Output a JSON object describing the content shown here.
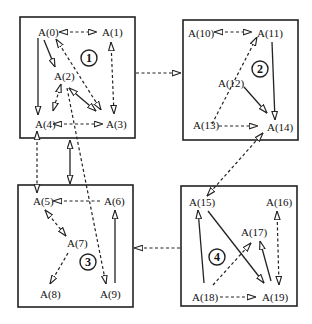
{
  "diagram": {
    "type": "agent-cluster-graph",
    "clusters": [
      {
        "id": "1",
        "label": "1",
        "nodes": [
          "A(0)",
          "A(1)",
          "A(2)",
          "A(3)",
          "A(4)"
        ]
      },
      {
        "id": "2",
        "label": "2",
        "nodes": [
          "A(10)",
          "A(11)",
          "A(12)",
          "A(13)",
          "A(14)"
        ]
      },
      {
        "id": "3",
        "label": "3",
        "nodes": [
          "A(5)",
          "A(6)",
          "A(7)",
          "A(8)",
          "A(9)"
        ]
      },
      {
        "id": "4",
        "label": "4",
        "nodes": [
          "A(15)",
          "A(16)",
          "A(17)",
          "A(18)",
          "A(19)"
        ]
      }
    ],
    "nodes": {
      "n0": "A(0)",
      "n1": "A(1)",
      "n2": "A(2)",
      "n3": "A(3)",
      "n4": "A(4)",
      "n5": "A(5)",
      "n6": "A(6)",
      "n7": "A(7)",
      "n8": "A(8)",
      "n9": "A(9)",
      "n10": "A(10)",
      "n11": "A(11)",
      "n12": "A(12)",
      "n13": "A(13)",
      "n14": "A(14)",
      "n15": "A(15)",
      "n16": "A(16)",
      "n17": "A(17)",
      "n18": "A(18)",
      "n19": "A(19)"
    },
    "cluster_labels": {
      "c1": "1",
      "c2": "2",
      "c3": "3",
      "c4": "4"
    },
    "edges": [
      {
        "from": "A(0)",
        "to": "A(1)",
        "style": "dashed",
        "bidirectional": true
      },
      {
        "from": "A(0)",
        "to": "A(4)",
        "style": "solid"
      },
      {
        "from": "A(0)",
        "to": "A(2)",
        "style": "solid"
      },
      {
        "from": "A(3)",
        "to": "A(0)",
        "style": "dashed",
        "bidirectional": true
      },
      {
        "from": "A(1)",
        "to": "A(3)",
        "style": "dashed",
        "bidirectional": true
      },
      {
        "from": "A(2)",
        "to": "A(3)",
        "style": "solid",
        "bidirectional": true
      },
      {
        "from": "A(2)",
        "to": "A(4)",
        "style": "dashed",
        "bidirectional": true
      },
      {
        "from": "A(4)",
        "to": "A(3)",
        "style": "dashed",
        "bidirectional": true
      },
      {
        "from": "A(2)",
        "to": "A(9)",
        "style": "dashed"
      },
      {
        "from": "A(4)",
        "to": "A(5)",
        "style": "dashed",
        "bidirectional": true
      },
      {
        "from": "cluster 1",
        "to": "cluster 3",
        "style": "solid",
        "bidirectional": true
      },
      {
        "from": "cluster 1",
        "to": "cluster 2",
        "style": "dashed"
      },
      {
        "from": "A(10)",
        "to": "A(11)",
        "style": "dashed",
        "bidirectional": true
      },
      {
        "from": "A(13)",
        "to": "A(11)",
        "style": "dashed"
      },
      {
        "from": "A(11)",
        "to": "A(14)",
        "style": "solid"
      },
      {
        "from": "A(12)",
        "to": "A(14)",
        "style": "solid"
      },
      {
        "from": "A(13)",
        "to": "A(14)",
        "style": "dashed"
      },
      {
        "from": "A(15)",
        "to": "A(14)",
        "style": "dashed",
        "bidirectional": true
      },
      {
        "from": "A(6)",
        "to": "A(5)",
        "style": "dashed"
      },
      {
        "from": "A(5)",
        "to": "A(7)",
        "style": "dashed",
        "bidirectional": true
      },
      {
        "from": "A(7)",
        "to": "A(8)",
        "style": "dashed"
      },
      {
        "from": "A(9)",
        "to": "A(6)",
        "style": "solid"
      },
      {
        "from": "cluster 4",
        "to": "cluster 3",
        "style": "dashed"
      },
      {
        "from": "A(18)",
        "to": "A(15)",
        "style": "solid"
      },
      {
        "from": "A(15)",
        "to": "A(19)",
        "style": "solid"
      },
      {
        "from": "A(18)",
        "to": "A(17)",
        "style": "dashed"
      },
      {
        "from": "A(19)",
        "to": "A(17)",
        "style": "solid"
      },
      {
        "from": "A(16)",
        "to": "A(19)",
        "style": "dashed",
        "bidirectional": true
      },
      {
        "from": "A(18)",
        "to": "A(19)",
        "style": "dashed"
      }
    ]
  }
}
